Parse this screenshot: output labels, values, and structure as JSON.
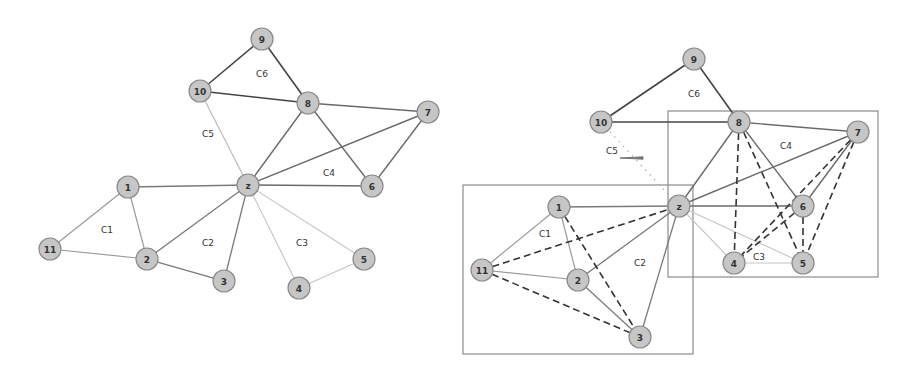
{
  "figure": {
    "left_panel": {
      "name": "original-community-graph",
      "nodes": [
        {
          "id": "9",
          "x": 262,
          "y": 39
        },
        {
          "id": "10",
          "x": 200,
          "y": 91
        },
        {
          "id": "8",
          "x": 308,
          "y": 103
        },
        {
          "id": "7",
          "x": 428,
          "y": 112
        },
        {
          "id": "z",
          "x": 248,
          "y": 185
        },
        {
          "id": "6",
          "x": 372,
          "y": 186
        },
        {
          "id": "1",
          "x": 128,
          "y": 187
        },
        {
          "id": "11",
          "x": 50,
          "y": 249
        },
        {
          "id": "2",
          "x": 147,
          "y": 259
        },
        {
          "id": "3",
          "x": 224,
          "y": 281
        },
        {
          "id": "4",
          "x": 299,
          "y": 288
        },
        {
          "id": "5",
          "x": 364,
          "y": 259
        }
      ],
      "edges": [
        {
          "a": "9",
          "b": "10",
          "style": "solid",
          "color": "#444444",
          "width": 1.6
        },
        {
          "a": "9",
          "b": "8",
          "style": "solid",
          "color": "#444444",
          "width": 1.6
        },
        {
          "a": "10",
          "b": "8",
          "style": "solid",
          "color": "#444444",
          "width": 1.6
        },
        {
          "a": "10",
          "b": "z",
          "style": "solid",
          "color": "#bbbbbb",
          "width": 1.2
        },
        {
          "a": "8",
          "b": "7",
          "style": "solid",
          "color": "#6a6a6a",
          "width": 1.4
        },
        {
          "a": "8",
          "b": "z",
          "style": "solid",
          "color": "#6a6a6a",
          "width": 1.4
        },
        {
          "a": "8",
          "b": "6",
          "style": "solid",
          "color": "#6a6a6a",
          "width": 1.4
        },
        {
          "a": "7",
          "b": "z",
          "style": "solid",
          "color": "#6a6a6a",
          "width": 1.4
        },
        {
          "a": "7",
          "b": "6",
          "style": "solid",
          "color": "#6a6a6a",
          "width": 1.4
        },
        {
          "a": "z",
          "b": "6",
          "style": "solid",
          "color": "#6a6a6a",
          "width": 1.4
        },
        {
          "a": "z",
          "b": "1",
          "style": "solid",
          "color": "#7a7a7a",
          "width": 1.3
        },
        {
          "a": "z",
          "b": "2",
          "style": "solid",
          "color": "#7a7a7a",
          "width": 1.3
        },
        {
          "a": "z",
          "b": "3",
          "style": "solid",
          "color": "#7a7a7a",
          "width": 1.3
        },
        {
          "a": "2",
          "b": "3",
          "style": "solid",
          "color": "#7a7a7a",
          "width": 1.3
        },
        {
          "a": "1",
          "b": "11",
          "style": "solid",
          "color": "#9a9a9a",
          "width": 1.2
        },
        {
          "a": "1",
          "b": "2",
          "style": "solid",
          "color": "#9a9a9a",
          "width": 1.2
        },
        {
          "a": "11",
          "b": "2",
          "style": "solid",
          "color": "#9a9a9a",
          "width": 1.2
        },
        {
          "a": "z",
          "b": "4",
          "style": "solid",
          "color": "#c4c4c4",
          "width": 1.1
        },
        {
          "a": "z",
          "b": "5",
          "style": "solid",
          "color": "#c4c4c4",
          "width": 1.1
        },
        {
          "a": "4",
          "b": "5",
          "style": "solid",
          "color": "#c4c4c4",
          "width": 1.1
        }
      ],
      "community_labels": [
        {
          "text": "C6",
          "x": 262,
          "y": 74
        },
        {
          "text": "C5",
          "x": 208,
          "y": 134
        },
        {
          "text": "C4",
          "x": 329,
          "y": 173
        },
        {
          "text": "C1",
          "x": 107,
          "y": 230
        },
        {
          "text": "C2",
          "x": 208,
          "y": 243
        },
        {
          "text": "C3",
          "x": 302,
          "y": 243
        }
      ],
      "boxes": []
    },
    "right_panel": {
      "name": "merged-community-graph",
      "nodes": [
        {
          "id": "9",
          "x": 694,
          "y": 59
        },
        {
          "id": "10",
          "x": 601,
          "y": 122
        },
        {
          "id": "8",
          "x": 739,
          "y": 122
        },
        {
          "id": "7",
          "x": 858,
          "y": 132
        },
        {
          "id": "z",
          "x": 679,
          "y": 206
        },
        {
          "id": "6",
          "x": 803,
          "y": 206
        },
        {
          "id": "1",
          "x": 559,
          "y": 207
        },
        {
          "id": "11",
          "x": 482,
          "y": 270
        },
        {
          "id": "2",
          "x": 578,
          "y": 280
        },
        {
          "id": "3",
          "x": 640,
          "y": 337
        },
        {
          "id": "4",
          "x": 734,
          "y": 263
        },
        {
          "id": "5",
          "x": 803,
          "y": 263
        }
      ],
      "edges": [
        {
          "a": "9",
          "b": "10",
          "style": "solid",
          "color": "#444444",
          "width": 1.6
        },
        {
          "a": "9",
          "b": "8",
          "style": "solid",
          "color": "#444444",
          "width": 1.6
        },
        {
          "a": "10",
          "b": "8",
          "style": "solid",
          "color": "#444444",
          "width": 1.6
        },
        {
          "a": "10",
          "b": "z",
          "style": "dotted",
          "color": "#aaaaaa",
          "width": 1.2
        },
        {
          "a": "8",
          "b": "7",
          "style": "solid",
          "color": "#6a6a6a",
          "width": 1.4
        },
        {
          "a": "8",
          "b": "z",
          "style": "solid",
          "color": "#6a6a6a",
          "width": 1.4
        },
        {
          "a": "8",
          "b": "6",
          "style": "solid",
          "color": "#6a6a6a",
          "width": 1.4
        },
        {
          "a": "7",
          "b": "z",
          "style": "solid",
          "color": "#6a6a6a",
          "width": 1.4
        },
        {
          "a": "7",
          "b": "6",
          "style": "solid",
          "color": "#6a6a6a",
          "width": 1.4
        },
        {
          "a": "z",
          "b": "6",
          "style": "solid",
          "color": "#6a6a6a",
          "width": 1.4
        },
        {
          "a": "z",
          "b": "1",
          "style": "solid",
          "color": "#7a7a7a",
          "width": 1.3
        },
        {
          "a": "z",
          "b": "2",
          "style": "solid",
          "color": "#7a7a7a",
          "width": 1.3
        },
        {
          "a": "z",
          "b": "3",
          "style": "solid",
          "color": "#7a7a7a",
          "width": 1.3
        },
        {
          "a": "2",
          "b": "3",
          "style": "solid",
          "color": "#7a7a7a",
          "width": 1.3
        },
        {
          "a": "1",
          "b": "11",
          "style": "solid",
          "color": "#9a9a9a",
          "width": 1.2
        },
        {
          "a": "1",
          "b": "2",
          "style": "solid",
          "color": "#9a9a9a",
          "width": 1.2
        },
        {
          "a": "11",
          "b": "2",
          "style": "solid",
          "color": "#9a9a9a",
          "width": 1.2
        },
        {
          "a": "z",
          "b": "4",
          "style": "solid",
          "color": "#c4c4c4",
          "width": 1.1
        },
        {
          "a": "z",
          "b": "5",
          "style": "solid",
          "color": "#c4c4c4",
          "width": 1.1
        },
        {
          "a": "4",
          "b": "5",
          "style": "solid",
          "color": "#c4c4c4",
          "width": 1.1
        },
        {
          "a": "11",
          "b": "z",
          "style": "dashed",
          "color": "#333333",
          "width": 1.6
        },
        {
          "a": "11",
          "b": "3",
          "style": "dashed",
          "color": "#333333",
          "width": 1.6
        },
        {
          "a": "1",
          "b": "3",
          "style": "dashed",
          "color": "#333333",
          "width": 1.6
        },
        {
          "a": "8",
          "b": "4",
          "style": "dashed",
          "color": "#333333",
          "width": 1.6
        },
        {
          "a": "8",
          "b": "5",
          "style": "dashed",
          "color": "#333333",
          "width": 1.6
        },
        {
          "a": "7",
          "b": "4",
          "style": "dashed",
          "color": "#333333",
          "width": 1.6
        },
        {
          "a": "7",
          "b": "5",
          "style": "dashed",
          "color": "#333333",
          "width": 1.6
        },
        {
          "a": "6",
          "b": "4",
          "style": "dashed",
          "color": "#333333",
          "width": 1.6
        },
        {
          "a": "6",
          "b": "5",
          "style": "dashed",
          "color": "#333333",
          "width": 1.6
        }
      ],
      "community_labels": [
        {
          "text": "C6",
          "x": 694,
          "y": 94
        },
        {
          "text": "C5",
          "x": 612,
          "y": 151
        },
        {
          "text": "C4",
          "x": 786,
          "y": 146
        },
        {
          "text": "C1",
          "x": 545,
          "y": 234
        },
        {
          "text": "C2",
          "x": 640,
          "y": 263
        },
        {
          "text": "C3",
          "x": 759,
          "y": 257
        }
      ],
      "boxes": [
        {
          "name": "merged-box-c1-c2",
          "x": 463,
          "y": 185,
          "w": 230,
          "h": 169
        },
        {
          "name": "merged-box-c3-c4",
          "x": 668,
          "y": 111,
          "w": 210,
          "h": 166
        }
      ],
      "arrow": {
        "x1": 620,
        "y1": 158,
        "x2": 643,
        "y2": 158,
        "color": "#777777"
      }
    },
    "node_radius": 11
  }
}
